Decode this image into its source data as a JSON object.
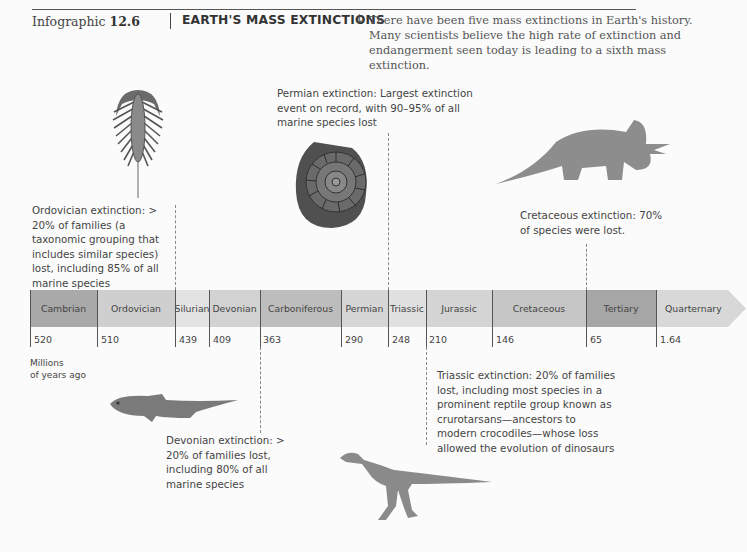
{
  "header": {
    "label": "Infographic",
    "number": "12.6",
    "title": "EARTH'S MASS EXTINCTIONS",
    "arrow_icon": "↓",
    "intro": "There have been five mass extinctions in Earth's history. Many scientists believe the high rate of extinction and endangerment seen today is leading to a sixth mass extinction."
  },
  "timeline": {
    "units_line1": "Millions",
    "units_line2": "of years ago",
    "periods": [
      {
        "name": "Cambrian",
        "start": "520",
        "color": "#a9a9a9"
      },
      {
        "name": "Ordovician",
        "start": "510",
        "color": "#cfcfcf"
      },
      {
        "name": "Silurian",
        "start": "439",
        "color": "#e3e3e3"
      },
      {
        "name": "Devonian",
        "start": "409",
        "color": "#d2d2d2"
      },
      {
        "name": "Carboniferous",
        "start": "363",
        "color": "#bdbdbd"
      },
      {
        "name": "Permian",
        "start": "290",
        "color": "#d6d6d6"
      },
      {
        "name": "Triassic",
        "start": "248",
        "color": "#e0e0e0"
      },
      {
        "name": "Jurassic",
        "start": "210",
        "color": "#d4d4d4"
      },
      {
        "name": "Cretaceous",
        "start": "146",
        "color": "#c6c6c6"
      },
      {
        "name": "Tertiary",
        "start": "65",
        "color": "#a6a6a6"
      },
      {
        "name": "Quarternary",
        "start": "1.64",
        "color": "#d8d8d8"
      }
    ]
  },
  "extinctions": {
    "ordovician": "Ordovician extinction: > 20% of families (a taxonomic grouping that includes similar species) lost, including 85% of all marine species",
    "permian": "Permian extinction: Largest extinction event on record, with 90–95% of all marine species lost",
    "cretaceous": "Cretaceous extinction: 70% of species were lost.",
    "triassic": "Triassic extinction: 20% of families lost, including most species in a prominent reptile group known as crurotarsans—ancestors to modern crocodiles—whose loss allowed the evolution of dinosaurs",
    "devonian": "Devonian extinction: > 20% of families lost, including 80% of all marine species"
  }
}
